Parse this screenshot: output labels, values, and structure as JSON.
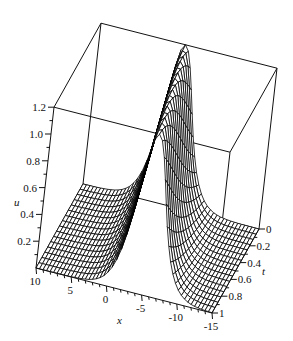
{
  "chart_data": {
    "type": "surface3d",
    "title": "",
    "function_description": "single soliton surface u(x,t) (sech^2 profile) drawn as black wireframe mesh",
    "xlabel": "x",
    "ylabel": "t",
    "zlabel": "u",
    "x_range": [
      -15,
      10
    ],
    "t_range": [
      0,
      1
    ],
    "u_range": [
      0,
      1.2
    ],
    "x_ticks": [
      10,
      5,
      0,
      -5,
      -10,
      -15
    ],
    "x_tick_labels": [
      "10",
      "5",
      "0",
      "-5",
      "-10",
      "-15"
    ],
    "t_ticks": [
      0,
      0.2,
      0.4,
      0.6,
      0.8,
      1
    ],
    "t_tick_labels": [
      "0",
      "0.2",
      "0.4",
      "0.6",
      "0.8",
      "1"
    ],
    "u_ticks": [
      0.2,
      0.4,
      0.6,
      0.8,
      1.0,
      1.2
    ],
    "u_tick_labels": [
      "0.2",
      "0.4",
      "0.6",
      "0.8",
      "1.0",
      "1.2"
    ],
    "peak_value": 1.2,
    "model": {
      "amplitude": 1.2,
      "width_k": 0.38,
      "center_x0": -2.0,
      "velocity": -3.0
    },
    "mesh": {
      "x_samples": 50,
      "t_samples": 16
    },
    "grid": false,
    "box": true,
    "legend": null,
    "colors": {
      "mesh": "#000000",
      "surface_fill": "#ffffff",
      "box": "#111111"
    }
  }
}
